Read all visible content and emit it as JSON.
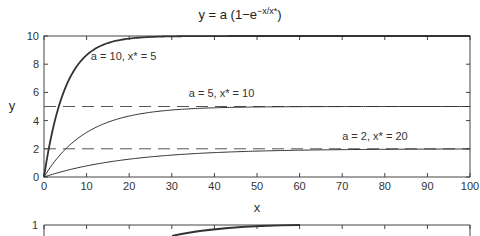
{
  "chart_data": [
    {
      "type": "line",
      "title": "y = a (1−e^(−x/x*))",
      "title_main": "y = a (1−e",
      "title_sup": "−x/x*",
      "title_end": ")",
      "xlabel": "x",
      "ylabel": "y",
      "xlim": [
        0,
        100
      ],
      "ylim": [
        0,
        10
      ],
      "xticks": [
        0,
        10,
        20,
        30,
        40,
        50,
        60,
        70,
        80,
        90,
        100
      ],
      "yticks": [
        0,
        2,
        4,
        6,
        8,
        10
      ],
      "grid": false,
      "series": [
        {
          "name": "a = 10, x* = 5",
          "a": 10,
          "xstar": 5,
          "style": "solid-thick"
        },
        {
          "name": "a = 5, x* = 10",
          "a": 5,
          "xstar": 10,
          "style": "solid"
        },
        {
          "name": "a = 2, x* = 20",
          "a": 2,
          "xstar": 20,
          "style": "solid"
        }
      ],
      "asymptotes": [
        {
          "y": 5,
          "style": "dashed"
        },
        {
          "y": 2,
          "style": "dashed"
        }
      ],
      "annotations": [
        {
          "text": "a = 10, x* = 5",
          "x": 11,
          "y": 8.3
        },
        {
          "text": "a = 5, x* = 10",
          "x": 34,
          "y": 5.7
        },
        {
          "text": "a = 2, x* = 20",
          "x": 70,
          "y": 2.6
        }
      ]
    },
    {
      "type": "line",
      "partial": true,
      "yticks": [
        1
      ],
      "xlim": [
        0,
        100
      ],
      "note": "second chart, only top edge visible"
    }
  ]
}
